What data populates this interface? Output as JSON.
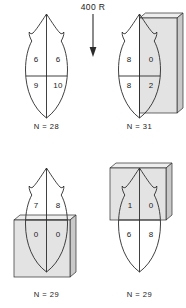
{
  "figure": {
    "dose_label": "400 R",
    "arrow_icon": "down-arrow-icon",
    "shape_icon": "leaf-outline-icon",
    "block_icon": "irradiation-block-icon",
    "colors": {
      "outline": "#2b2b2b",
      "block_face": "#e3e3e3",
      "block_side": "#c9c9c9",
      "block_top": "#eeeeee",
      "text": "#1a1a1a",
      "background": "#ffffff"
    }
  },
  "panels": [
    {
      "id": "panel-top-left",
      "name": "control-unshielded",
      "n_label": "N = 28",
      "block": "none",
      "quadrants": {
        "upper_left": "6",
        "upper_right": "6",
        "lower_left": "9",
        "lower_right": "10"
      }
    },
    {
      "id": "panel-top-right",
      "name": "right-half-shielded",
      "n_label": "N = 31",
      "block": "right",
      "quadrants": {
        "upper_left": "8",
        "upper_right": "0",
        "lower_left": "8",
        "lower_right": "2"
      }
    },
    {
      "id": "panel-bottom-left",
      "name": "lower-half-shielded",
      "n_label": "N = 29",
      "block": "bottom",
      "quadrants": {
        "upper_left": "7",
        "upper_right": "8",
        "lower_left": "0",
        "lower_right": "0"
      }
    },
    {
      "id": "panel-bottom-right",
      "name": "upper-half-shielded",
      "n_label": "N = 29",
      "block": "top",
      "quadrants": {
        "upper_left": "1",
        "upper_right": "0",
        "lower_left": "6",
        "lower_right": "8"
      }
    }
  ]
}
